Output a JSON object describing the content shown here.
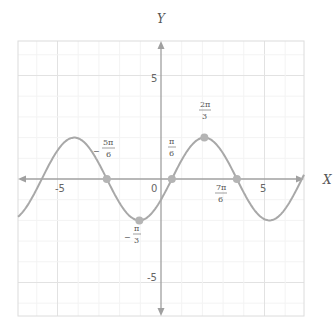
{
  "chart_data": {
    "type": "line",
    "title": "",
    "xlabel": "X",
    "ylabel": "Y",
    "function": "y = 2 sin(x - π/6)",
    "xlim": [
      -6.9,
      6.9
    ],
    "ylim": [
      -6.6,
      6.6
    ],
    "grid": true,
    "x_ticks": [
      {
        "value": -5,
        "label": "-5"
      },
      {
        "value": 0,
        "label": "0"
      },
      {
        "value": 5,
        "label": "5"
      }
    ],
    "y_ticks": [
      {
        "value": 5,
        "label": "5"
      },
      {
        "value": -5,
        "label": "-5"
      }
    ],
    "series": [
      {
        "name": "2sin(x-π/6)",
        "amplitude": 2,
        "phase_shift": 0.5236,
        "period": 6.2832
      }
    ],
    "points": [
      {
        "x": -2.618,
        "y": 0,
        "label_num": "5π",
        "label_den": "6",
        "sign": "−"
      },
      {
        "x": -1.047,
        "y": -2,
        "label_num": "π",
        "label_den": "3",
        "sign": "−"
      },
      {
        "x": 0.524,
        "y": 0,
        "label_num": "π",
        "label_den": "6",
        "sign": ""
      },
      {
        "x": 2.094,
        "y": 2,
        "label_num": "2π",
        "label_den": "3",
        "sign": ""
      },
      {
        "x": 3.665,
        "y": 0,
        "label_num": "7π",
        "label_den": "6",
        "sign": ""
      }
    ]
  },
  "labels": {
    "x_axis": "X",
    "y_axis": "Y",
    "origin": "0",
    "xtick_neg5": "-5",
    "xtick_5": "5",
    "ytick_5": "5",
    "ytick_neg5": "-5",
    "p1_sign": "−",
    "p1_num": "5π",
    "p1_den": "6",
    "p2_sign": "−",
    "p2_num": "π",
    "p2_den": "3",
    "p3_num": "π",
    "p3_den": "6",
    "p4_num": "2π",
    "p4_den": "3",
    "p5_num": "7π",
    "p5_den": "6"
  },
  "colors": {
    "curve": "#a8a8a8",
    "points": "#b4b4b4",
    "axis": "#a0a0a0",
    "grid": "#ececec",
    "frame": "#dddddd"
  }
}
